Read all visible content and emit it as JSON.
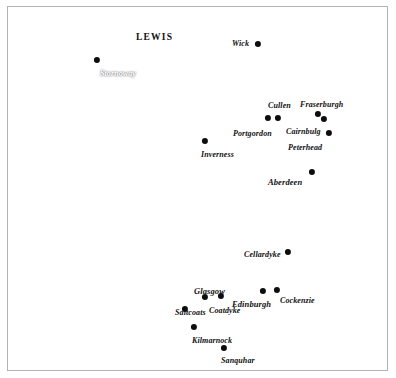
{
  "figure": {
    "width": 396,
    "height": 378,
    "frame_color": "#b3b3b3",
    "land_color": "#111111",
    "sea_color": "#ffffff"
  },
  "regions": [
    {
      "name": "LEWIS",
      "label": "LEWIS",
      "x": 136,
      "y": 33,
      "font_size": 9.5,
      "on_dark": false
    }
  ],
  "places": [
    {
      "name": "stornoway",
      "label": "Stornoway",
      "dot_x": 97,
      "dot_y": 60,
      "label_x": 100,
      "label_y": 70,
      "anchor": "left",
      "on_dark": true,
      "font_size": 8
    },
    {
      "name": "wick",
      "label": "Wick",
      "dot_x": 258,
      "dot_y": 44,
      "label_x": 232,
      "label_y": 40,
      "anchor": "left",
      "on_dark": false,
      "font_size": 8
    },
    {
      "name": "cullen",
      "label": "Cullen",
      "dot_x": 278,
      "dot_y": 118,
      "label_x": 268,
      "label_y": 102,
      "anchor": "left",
      "on_dark": false,
      "font_size": 8
    },
    {
      "name": "fraserburgh",
      "label": "Fraserburgh",
      "dot_x": 318,
      "dot_y": 114,
      "label_x": 300,
      "label_y": 101,
      "anchor": "left",
      "on_dark": false,
      "font_size": 8
    },
    {
      "name": "portgordon",
      "label": "Portgordon",
      "dot_x": 268,
      "dot_y": 118,
      "label_x": 233,
      "label_y": 130,
      "anchor": "left",
      "on_dark": false,
      "font_size": 8
    },
    {
      "name": "cairnbulg",
      "label": "Cairnbulg",
      "dot_x": 324,
      "dot_y": 119,
      "label_x": 286,
      "label_y": 128,
      "anchor": "left",
      "on_dark": false,
      "font_size": 8
    },
    {
      "name": "peterhead",
      "label": "Peterhead",
      "dot_x": 329,
      "dot_y": 133,
      "label_x": 288,
      "label_y": 144,
      "anchor": "left",
      "on_dark": false,
      "font_size": 8
    },
    {
      "name": "inverness",
      "label": "Inverness",
      "dot_x": 205,
      "dot_y": 141,
      "label_x": 201,
      "label_y": 151,
      "anchor": "left",
      "on_dark": false,
      "font_size": 8
    },
    {
      "name": "aberdeen",
      "label": "Aberdeen",
      "dot_x": 312,
      "dot_y": 172,
      "label_x": 268,
      "label_y": 178,
      "anchor": "left",
      "on_dark": false,
      "font_size": 8.5
    },
    {
      "name": "cellardyke",
      "label": "Cellardyke",
      "dot_x": 288,
      "dot_y": 252,
      "label_x": 244,
      "label_y": 251,
      "anchor": "left",
      "on_dark": false,
      "font_size": 8
    },
    {
      "name": "glasgow",
      "label": "Glasgow",
      "dot_x": 205,
      "dot_y": 297,
      "label_x": 194,
      "label_y": 287,
      "anchor": "left",
      "on_dark": false,
      "font_size": 8.5
    },
    {
      "name": "coatdyke",
      "label": "Coatdyke",
      "dot_x": 221,
      "dot_y": 296,
      "label_x": 209,
      "label_y": 307,
      "anchor": "left",
      "on_dark": false,
      "font_size": 8
    },
    {
      "name": "edinburgh",
      "label": "Edinburgh",
      "dot_x": 263,
      "dot_y": 291,
      "label_x": 232,
      "label_y": 300,
      "anchor": "left",
      "on_dark": false,
      "font_size": 8.5
    },
    {
      "name": "cockenzie",
      "label": "Cockenzie",
      "dot_x": 277,
      "dot_y": 290,
      "label_x": 280,
      "label_y": 297,
      "anchor": "left",
      "on_dark": false,
      "font_size": 8
    },
    {
      "name": "saltcoats",
      "label": "Saltcoats",
      "dot_x": 185,
      "dot_y": 309,
      "label_x": 175,
      "label_y": 309,
      "anchor": "left",
      "on_dark": false,
      "font_size": 8
    },
    {
      "name": "kilmarnock",
      "label": "Kilmarnock",
      "dot_x": 194,
      "dot_y": 327,
      "label_x": 192,
      "label_y": 337,
      "anchor": "left",
      "on_dark": false,
      "font_size": 8
    },
    {
      "name": "sanquhar",
      "label": "Sanquhar",
      "dot_x": 224,
      "dot_y": 348,
      "label_x": 221,
      "label_y": 357,
      "anchor": "left",
      "on_dark": false,
      "font_size": 8
    }
  ],
  "dot_radius": 3.1
}
